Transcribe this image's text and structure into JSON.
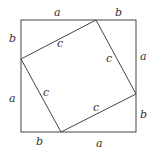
{
  "diagram": {
    "line_color": "#444444",
    "outer_square": {
      "x1": 21,
      "y1": 20,
      "x2": 136,
      "y2": 132
    },
    "inner_square": {
      "points": [
        [
          96,
          20
        ],
        [
          136,
          94
        ],
        [
          61,
          132
        ],
        [
          21,
          59
        ]
      ]
    },
    "labels": {
      "top_a": "a",
      "top_b": "b",
      "right_a": "a",
      "right_b": "b",
      "bottom_b": "b",
      "bottom_a": "a",
      "left_b": "b",
      "left_a": "a",
      "c_top": "c",
      "c_right": "c",
      "c_bottom": "c",
      "c_left": "c"
    }
  }
}
